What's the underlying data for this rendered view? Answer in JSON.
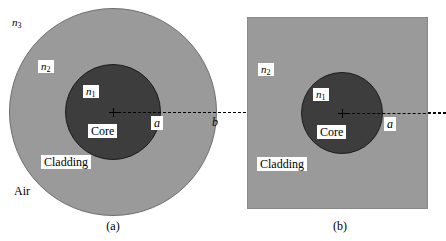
{
  "figure": {
    "colors": {
      "core": "#3d3d3d",
      "cladding": "#9a9a9a",
      "air": "#ffffff",
      "outline": "#1c1c1c",
      "axis": "#000000"
    }
  },
  "panel_a": {
    "caption": "(a)",
    "labels": {
      "n3": "n",
      "n3_sub": "3",
      "n2": "n",
      "n2_sub": "2",
      "n1": "n",
      "n1_sub": "1",
      "core": "Core",
      "cladding": "Cladding",
      "air": "Air",
      "radius_a": "a",
      "radius_b": "b"
    }
  },
  "panel_b": {
    "caption": "(b)",
    "labels": {
      "n2": "n",
      "n2_sub": "2",
      "n1": "n",
      "n1_sub": "1",
      "core": "Core",
      "cladding": "Cladding",
      "radius_a": "a"
    }
  }
}
